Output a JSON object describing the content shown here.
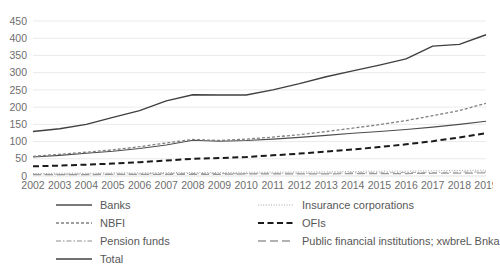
{
  "chart_data": {
    "type": "line",
    "title": "",
    "xlabel": "",
    "ylabel": "",
    "grid": true,
    "legend_position": "bottom",
    "ylim": [
      0,
      450
    ],
    "ytick_step": 50,
    "yticks": [
      "0",
      "50",
      "100",
      "150",
      "200",
      "250",
      "300",
      "350",
      "400",
      "450"
    ],
    "categories": [
      "2002",
      "2003",
      "2004",
      "2005",
      "2006",
      "2007",
      "2008",
      "2009",
      "2010",
      "2011",
      "2012",
      "2013",
      "2014",
      "2015",
      "2016",
      "2017",
      "2018",
      "2019"
    ],
    "series": [
      {
        "name": "Banks",
        "style": "solid-thin",
        "color": "#4d4d4d",
        "values": [
          55,
          60,
          66,
          72,
          80,
          90,
          104,
          101,
          103,
          107,
          112,
          118,
          124,
          129,
          135,
          142,
          150,
          159
        ]
      },
      {
        "name": "NBFI",
        "style": "dotted-medium",
        "color": "#808080",
        "values": [
          57,
          63,
          69,
          76,
          85,
          96,
          106,
          103,
          107,
          113,
          120,
          129,
          139,
          149,
          161,
          175,
          190,
          211
        ]
      },
      {
        "name": "Pension funds",
        "style": "dash-dot-light",
        "color": "#b3b3b3",
        "values": [
          5,
          5,
          6,
          6,
          6,
          7,
          7,
          7,
          7,
          8,
          8,
          8,
          9,
          9,
          10,
          10,
          11,
          12
        ]
      },
      {
        "name": "Total",
        "style": "solid-thick",
        "color": "#404040",
        "values": [
          129,
          137,
          150,
          170,
          190,
          218,
          236,
          235,
          235,
          250,
          268,
          288,
          305,
          322,
          340,
          377,
          382,
          410
        ]
      },
      {
        "name": "Insurance corporations",
        "style": "fine-dotted",
        "color": "#a6a6a6",
        "values": [
          7,
          8,
          8,
          9,
          9,
          10,
          10,
          10,
          11,
          11,
          12,
          12,
          13,
          14,
          14,
          15,
          16,
          17
        ]
      },
      {
        "name": "OFIs",
        "style": "bold-dashed",
        "color": "#1a1a1a",
        "values": [
          28,
          30,
          33,
          36,
          40,
          45,
          50,
          52,
          55,
          60,
          65,
          71,
          77,
          84,
          92,
          101,
          112,
          124
        ]
      },
      {
        "name": "Public financial institutions; xwbreL Bnka",
        "style": "long-dash",
        "color": "#999999",
        "values": [
          4,
          4,
          4,
          5,
          5,
          5,
          5,
          5,
          6,
          6,
          6,
          6,
          7,
          7,
          7,
          8,
          8,
          9
        ]
      }
    ]
  },
  "legend": {
    "left_column": [
      {
        "label": "Banks",
        "swatch": "solid-thin-swatch"
      },
      {
        "label": "NBFI",
        "swatch": "dotted-medium-swatch"
      },
      {
        "label": "Pension funds",
        "swatch": "dash-dot-light-swatch"
      },
      {
        "label": "Total",
        "swatch": "solid-thick-swatch"
      }
    ],
    "right_column": [
      {
        "label": "Insurance corporations",
        "swatch": "fine-dotted-swatch"
      },
      {
        "label": "OFIs",
        "swatch": "bold-dashed-swatch"
      },
      {
        "label": "Public financial institutions; xwbreL Bnka",
        "swatch": "long-dash-swatch"
      }
    ]
  },
  "colors": {
    "background": "#ffffff",
    "gridline": "#e4e4e4",
    "tick_text": "#6e6e6e"
  }
}
